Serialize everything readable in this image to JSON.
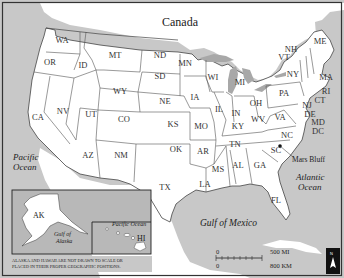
{
  "map": {
    "title_country_north": "Canada",
    "title_country_south": "Mexico",
    "colors": {
      "land": "#ffffff",
      "water": "#c8c8c8",
      "border": "#555555",
      "frame": "#333333",
      "inset_water": "#b4b4b4"
    },
    "water_labels": {
      "pacific": [
        "Pacific",
        "Ocean"
      ],
      "atlantic": [
        "Atlantic",
        "Ocean"
      ],
      "gulf_mexico": "Gulf of Mexico",
      "gulf_alaska": [
        "Gulf of",
        "Alaska"
      ],
      "pacific_inset": "Pacific Ocean"
    },
    "states": [
      {
        "abbr": "WA",
        "x": 62,
        "y": 43
      },
      {
        "abbr": "OR",
        "x": 50,
        "y": 65
      },
      {
        "abbr": "ID",
        "x": 83,
        "y": 68
      },
      {
        "abbr": "MT",
        "x": 115,
        "y": 58
      },
      {
        "abbr": "ND",
        "x": 160,
        "y": 58
      },
      {
        "abbr": "SD",
        "x": 160,
        "y": 79
      },
      {
        "abbr": "WY",
        "x": 120,
        "y": 94
      },
      {
        "abbr": "NE",
        "x": 165,
        "y": 104
      },
      {
        "abbr": "MN",
        "x": 185,
        "y": 66
      },
      {
        "abbr": "WI",
        "x": 213,
        "y": 80
      },
      {
        "abbr": "MI",
        "x": 240,
        "y": 85
      },
      {
        "abbr": "IA",
        "x": 195,
        "y": 100
      },
      {
        "abbr": "IL",
        "x": 219,
        "y": 112
      },
      {
        "abbr": "IN",
        "x": 236,
        "y": 116
      },
      {
        "abbr": "OH",
        "x": 256,
        "y": 106
      },
      {
        "abbr": "PA",
        "x": 284,
        "y": 96
      },
      {
        "abbr": "NY",
        "x": 293,
        "y": 77
      },
      {
        "abbr": "CA",
        "x": 38,
        "y": 120
      },
      {
        "abbr": "NV",
        "x": 63,
        "y": 114
      },
      {
        "abbr": "UT",
        "x": 91,
        "y": 117
      },
      {
        "abbr": "CO",
        "x": 124,
        "y": 122
      },
      {
        "abbr": "KS",
        "x": 173,
        "y": 127
      },
      {
        "abbr": "MO",
        "x": 201,
        "y": 129
      },
      {
        "abbr": "KY",
        "x": 238,
        "y": 129
      },
      {
        "abbr": "WV",
        "x": 258,
        "y": 122
      },
      {
        "abbr": "VA",
        "x": 280,
        "y": 120
      },
      {
        "abbr": "NC",
        "x": 287,
        "y": 138
      },
      {
        "abbr": "TN",
        "x": 235,
        "y": 147
      },
      {
        "abbr": "OK",
        "x": 176,
        "y": 152
      },
      {
        "abbr": "AR",
        "x": 203,
        "y": 154
      },
      {
        "abbr": "AZ",
        "x": 88,
        "y": 158
      },
      {
        "abbr": "NM",
        "x": 121,
        "y": 158
      },
      {
        "abbr": "TX",
        "x": 165,
        "y": 190
      },
      {
        "abbr": "MS",
        "x": 218,
        "y": 172
      },
      {
        "abbr": "AL",
        "x": 238,
        "y": 168
      },
      {
        "abbr": "GA",
        "x": 260,
        "y": 168
      },
      {
        "abbr": "SC",
        "x": 276,
        "y": 153
      },
      {
        "abbr": "LA",
        "x": 205,
        "y": 187
      },
      {
        "abbr": "FL",
        "x": 276,
        "y": 203
      },
      {
        "abbr": "AK",
        "x": 42,
        "y": 217
      },
      {
        "abbr": "HI",
        "x": 141,
        "y": 240
      }
    ],
    "callout_states": [
      {
        "abbr": "NH",
        "x": 291,
        "y": 52
      },
      {
        "abbr": "VT",
        "x": 284,
        "y": 60
      },
      {
        "abbr": "ME",
        "x": 320,
        "y": 44
      },
      {
        "abbr": "MA",
        "x": 326,
        "y": 80
      },
      {
        "abbr": "RI",
        "x": 326,
        "y": 94
      },
      {
        "abbr": "CT",
        "x": 320,
        "y": 103
      },
      {
        "abbr": "NJ",
        "x": 307,
        "y": 108
      },
      {
        "abbr": "DE",
        "x": 310,
        "y": 117
      },
      {
        "abbr": "MD",
        "x": 318,
        "y": 125
      },
      {
        "abbr": "DC",
        "x": 318,
        "y": 134
      }
    ],
    "marker": {
      "label": "Mars Bluff",
      "x": 280,
      "y": 146
    },
    "inset_note": [
      "ALASKA AND HAWAII ARE NOT DRAWN TO SCALE OR",
      "PLACED IN THEIR PROPER GEOGRAPHIC POSITIONS."
    ],
    "scale": {
      "top_zero": "0",
      "top_label": "500 MI",
      "bottom_zero": "0",
      "bottom_label": "800 KM"
    },
    "north_arrow": {
      "label": "N"
    }
  }
}
